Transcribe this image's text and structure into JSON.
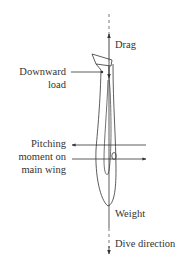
{
  "diagram": {
    "colors": {
      "line": "#333333",
      "text": "#333333",
      "background": "#ffffff"
    },
    "labels": {
      "drag": "Drag",
      "downward_load_line1": "Downward",
      "downward_load_line2": "load",
      "pitching_line1": "Pitching",
      "pitching_line2": "moment on",
      "pitching_line3": "main wing",
      "weight": "Weight",
      "dive_direction": "Dive direction"
    },
    "arrows": [
      {
        "name": "drag",
        "direction": "up"
      },
      {
        "name": "downward-load",
        "direction": "down"
      },
      {
        "name": "pitching-moment-upper",
        "direction": "left"
      },
      {
        "name": "pitching-moment-lower",
        "direction": "right"
      },
      {
        "name": "weight",
        "direction": "down"
      },
      {
        "name": "dive-direction",
        "direction": "down"
      }
    ]
  }
}
